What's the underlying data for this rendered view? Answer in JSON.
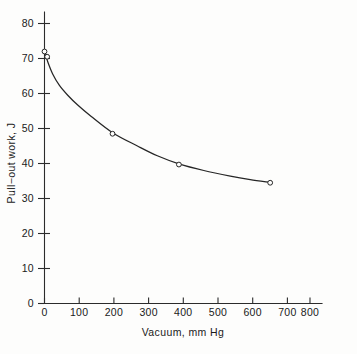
{
  "chart_data": {
    "type": "line",
    "title": "",
    "subtitle": "",
    "xlabel": "Vacuum, mm Hg",
    "ylabel": "Pull−out work, J",
    "xlim": [
      0,
      880
    ],
    "ylim": [
      0,
      84
    ],
    "xticks": [
      0,
      100,
      200,
      300,
      400,
      500,
      600,
      700,
      800
    ],
    "yticks": [
      0,
      10,
      20,
      30,
      40,
      50,
      60,
      70,
      80
    ],
    "xtick_labels": [
      "0",
      "100",
      "200",
      "300",
      "400",
      "500",
      "600",
      "700",
      "800"
    ],
    "ytick_labels": [
      "0",
      "10",
      "20",
      "30",
      "40",
      "50",
      "60",
      "70",
      "80"
    ],
    "grid": false,
    "legend": null,
    "legend_position": "none",
    "marker": "open-circle",
    "series": [
      {
        "name": "Pull-out work",
        "x": [
          0,
          8,
          205,
          405,
          680
        ],
        "values": [
          72.0,
          70.5,
          48.5,
          39.7,
          34.5
        ]
      }
    ],
    "curve_points": [
      {
        "x": 2,
        "y": 71.5
      },
      {
        "x": 10,
        "y": 69.0
      },
      {
        "x": 25,
        "y": 65.5
      },
      {
        "x": 45,
        "y": 62.3
      },
      {
        "x": 70,
        "y": 59.5
      },
      {
        "x": 100,
        "y": 56.7
      },
      {
        "x": 140,
        "y": 53.5
      },
      {
        "x": 205,
        "y": 48.8
      },
      {
        "x": 280,
        "y": 45.0
      },
      {
        "x": 340,
        "y": 42.2
      },
      {
        "x": 405,
        "y": 39.9
      },
      {
        "x": 480,
        "y": 38.0
      },
      {
        "x": 560,
        "y": 36.4
      },
      {
        "x": 620,
        "y": 35.4
      },
      {
        "x": 680,
        "y": 34.6
      }
    ],
    "annotations": []
  },
  "axes": {
    "x_axis_name": "x-axis",
    "y_axis_name": "y-axis"
  }
}
